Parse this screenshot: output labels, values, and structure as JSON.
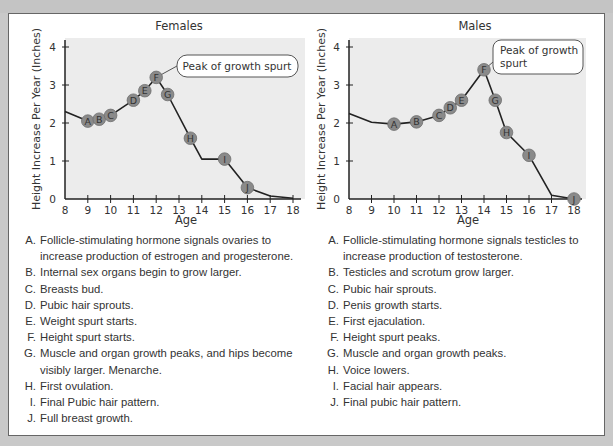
{
  "chart_data": [
    {
      "type": "line",
      "title": "Females",
      "xlabel": "Age",
      "ylabel": "Height Increase Per Year (Inches)",
      "xlim": [
        8,
        18
      ],
      "ylim": [
        0,
        4
      ],
      "x_ticks": [
        8,
        9,
        10,
        11,
        12,
        13,
        14,
        15,
        16,
        17,
        18
      ],
      "y_ticks": [
        0,
        1,
        2,
        3,
        4
      ],
      "grid": false,
      "annotation": "Peak of growth spurt",
      "line": [
        [
          8,
          2.3
        ],
        [
          9,
          2.05
        ],
        [
          9.5,
          2.1
        ],
        [
          10,
          2.2
        ],
        [
          11,
          2.6
        ],
        [
          11.5,
          2.85
        ],
        [
          12,
          3.2
        ],
        [
          12.5,
          2.75
        ],
        [
          13.5,
          1.6
        ],
        [
          14,
          1.05
        ],
        [
          15,
          1.05
        ],
        [
          16,
          0.3
        ],
        [
          17,
          0.08
        ],
        [
          18,
          0.02
        ]
      ],
      "markers": [
        {
          "label": "A",
          "x": 9,
          "y": 2.05
        },
        {
          "label": "B",
          "x": 9.5,
          "y": 2.1
        },
        {
          "label": "C",
          "x": 10,
          "y": 2.2
        },
        {
          "label": "D",
          "x": 11,
          "y": 2.6
        },
        {
          "label": "E",
          "x": 11.5,
          "y": 2.85
        },
        {
          "label": "F",
          "x": 12,
          "y": 3.2
        },
        {
          "label": "G",
          "x": 12.5,
          "y": 2.75
        },
        {
          "label": "H",
          "x": 13.5,
          "y": 1.6
        },
        {
          "label": "I",
          "x": 15,
          "y": 1.05
        },
        {
          "label": "J",
          "x": 16,
          "y": 0.3
        }
      ]
    },
    {
      "type": "line",
      "title": "Males",
      "xlabel": "Age",
      "ylabel": "Height Increase Per Year (Inches)",
      "xlim": [
        8,
        18
      ],
      "ylim": [
        0,
        4
      ],
      "x_ticks": [
        8,
        9,
        10,
        11,
        12,
        13,
        14,
        15,
        16,
        17,
        18
      ],
      "y_ticks": [
        0,
        1,
        2,
        3,
        4
      ],
      "grid": false,
      "annotation": "Peak of growth spurt",
      "line": [
        [
          8,
          2.25
        ],
        [
          9,
          2.02
        ],
        [
          10,
          1.97
        ],
        [
          11,
          2.03
        ],
        [
          12,
          2.2
        ],
        [
          12.5,
          2.4
        ],
        [
          13,
          2.6
        ],
        [
          14,
          3.4
        ],
        [
          14.5,
          2.6
        ],
        [
          15,
          1.75
        ],
        [
          16,
          1.15
        ],
        [
          17,
          0.1
        ],
        [
          18,
          0
        ]
      ],
      "markers": [
        {
          "label": "A",
          "x": 10,
          "y": 1.97
        },
        {
          "label": "B",
          "x": 11,
          "y": 2.03
        },
        {
          "label": "C",
          "x": 12,
          "y": 2.2
        },
        {
          "label": "D",
          "x": 12.5,
          "y": 2.4
        },
        {
          "label": "E",
          "x": 13,
          "y": 2.6
        },
        {
          "label": "F",
          "x": 14,
          "y": 3.4
        },
        {
          "label": "G",
          "x": 14.5,
          "y": 2.6
        },
        {
          "label": "H",
          "x": 15,
          "y": 1.75
        },
        {
          "label": "I",
          "x": 16,
          "y": 1.15
        },
        {
          "label": "J",
          "x": 18,
          "y": 0
        }
      ]
    }
  ],
  "females": {
    "title": "Females",
    "xlabel": "Age",
    "ylabel": "Height Increase Per Year (Inches)",
    "callout": "Peak of growth spurt",
    "legend": [
      {
        "letter": "A.",
        "text": "Follicle-stimulating hormone signals ovaries to increase production of estrogen and progesterone."
      },
      {
        "letter": "B.",
        "text": "Internal sex organs begin to grow larger."
      },
      {
        "letter": "C.",
        "text": "Breasts bud."
      },
      {
        "letter": "D.",
        "text": "Pubic hair sprouts."
      },
      {
        "letter": "E.",
        "text": "Weight spurt starts."
      },
      {
        "letter": "F.",
        "text": "Height spurt starts."
      },
      {
        "letter": "G.",
        "text": "Muscle and organ growth peaks, and hips become visibly larger. Menarche."
      },
      {
        "letter": "H.",
        "text": "First ovulation."
      },
      {
        "letter": "I.",
        "text": "Final Pubic hair pattern."
      },
      {
        "letter": "J.",
        "text": "Full breast growth."
      }
    ]
  },
  "males": {
    "title": "Males",
    "xlabel": "Age",
    "ylabel": "Height Increase Per Year (Inches)",
    "callout_line1": "Peak of growth",
    "callout_line2": "spurt",
    "legend": [
      {
        "letter": "A.",
        "text": "Follicle-stimulating hormone signals testicles to increase production of testosterone."
      },
      {
        "letter": "B.",
        "text": "Testicles and scrotum grow larger."
      },
      {
        "letter": "C.",
        "text": "Pubic hair sprouts."
      },
      {
        "letter": "D.",
        "text": "Penis growth starts."
      },
      {
        "letter": "E.",
        "text": "First ejaculation."
      },
      {
        "letter": "F.",
        "text": "Height spurt peaks."
      },
      {
        "letter": "G.",
        "text": "Muscle and organ growth peaks."
      },
      {
        "letter": "H.",
        "text": "Voice lowers."
      },
      {
        "letter": "I.",
        "text": "Facial hair appears."
      },
      {
        "letter": "J.",
        "text": "Final pubic hair pattern."
      }
    ]
  },
  "colors": {
    "plot_bg": "#ececec",
    "line": "#222222",
    "marker_fill": "#8a8a8a",
    "marker_stroke": "#6e6e6e",
    "marker_text": "#333333",
    "page_bg": "#c9c9c9"
  }
}
